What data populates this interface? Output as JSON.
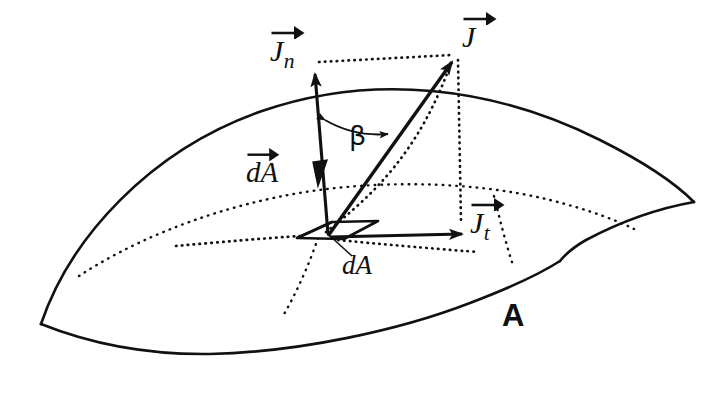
{
  "figure": {
    "kind": "vector-decomposition-on-curved-surface",
    "background_color": "#ffffff",
    "ink_color": "#111111",
    "labels": {
      "j_vector": {
        "symbol": "J",
        "subscript": "",
        "has_arrow": true,
        "text": "J"
      },
      "jn_vector": {
        "symbol": "J",
        "subscript": "n",
        "has_arrow": true,
        "text": "Jn"
      },
      "jt_vector": {
        "symbol": "J",
        "subscript": "t",
        "has_arrow": true,
        "text": "Jt"
      },
      "da_vector": {
        "symbol": "dA",
        "subscript": "",
        "has_arrow": true,
        "text": "dA"
      },
      "da_scalar": {
        "symbol": "dA",
        "subscript": "",
        "has_arrow": false,
        "text": "dA"
      },
      "angle": {
        "symbol": "β",
        "subscript": "",
        "has_arrow": false,
        "text": "β"
      },
      "surface": {
        "symbol": "A",
        "subscript": "",
        "has_arrow": false,
        "text": "A"
      }
    },
    "elements": {
      "surface_patch": "curved quadrilateral sheet labeled A",
      "area_element": "small parallelogram labeled dA",
      "normal_vector": "vertical arrow labeled Jn and dA vector",
      "tangential_vector": "horizontal arrow labeled Jt",
      "total_vector": "oblique arrow labeled J",
      "angle_arc": "double-headed arc between normal and J labeled beta",
      "projection_lines": "dotted construction lines completing the rectangle",
      "grid_curves": "dotted curves drawn across the surface"
    }
  }
}
